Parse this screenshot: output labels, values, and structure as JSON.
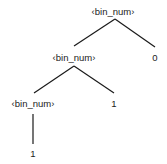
{
  "diagram": {
    "type": "parse-tree",
    "nodes": [
      {
        "id": "root",
        "label": "‹bin_num›",
        "x": 113,
        "y": 12
      },
      {
        "id": "mid",
        "label": "‹bin_num›",
        "x": 74,
        "y": 58
      },
      {
        "id": "zero",
        "label": "0",
        "x": 155,
        "y": 58
      },
      {
        "id": "low",
        "label": "‹bin_num›",
        "x": 33,
        "y": 104
      },
      {
        "id": "one_right",
        "label": "1",
        "x": 114,
        "y": 104
      },
      {
        "id": "one_leaf",
        "label": "1",
        "x": 33,
        "y": 154
      }
    ],
    "edges": [
      {
        "from": "root",
        "to": "mid"
      },
      {
        "from": "root",
        "to": "zero"
      },
      {
        "from": "mid",
        "to": "low"
      },
      {
        "from": "mid",
        "to": "one_right"
      },
      {
        "from": "low",
        "to": "one_leaf"
      }
    ]
  }
}
